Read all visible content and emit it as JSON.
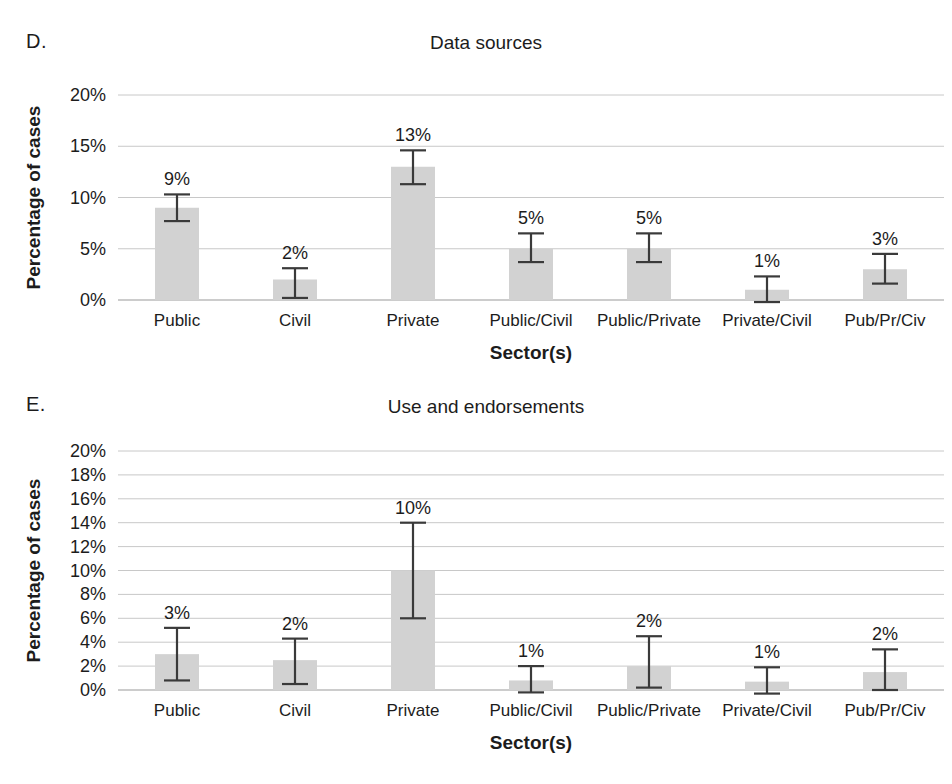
{
  "figure": {
    "background": "#ffffff",
    "bar_color": "#d2d2d2",
    "error_bar_color": "#3a3a3a",
    "gridline_color": "#c8c8c8"
  },
  "panels": [
    {
      "letter": "D.",
      "title": "Data sources"
    },
    {
      "letter": "E.",
      "title": "Use and endorsements"
    }
  ],
  "chart_data": [
    {
      "type": "bar",
      "panel": "D",
      "title": "Data sources",
      "xlabel": "Sector(s)",
      "ylabel": "Percentage of cases",
      "categories": [
        "Public",
        "Civil",
        "Private",
        "Public/Civil",
        "Public/Private",
        "Private/Civil",
        "Pub/Pr/Civ"
      ],
      "values": [
        9,
        2,
        13,
        5,
        5,
        1,
        3
      ],
      "value_labels": [
        "9%",
        "2%",
        "13%",
        "5%",
        "5%",
        "1%",
        "3%"
      ],
      "error_low": [
        7.7,
        0.2,
        11.3,
        3.7,
        3.7,
        -0.2,
        1.6
      ],
      "error_high": [
        10.3,
        3.1,
        14.6,
        6.5,
        6.5,
        2.3,
        4.5
      ],
      "ylim": [
        0,
        20
      ],
      "yticks": [
        0,
        5,
        10,
        15,
        20
      ],
      "ytick_labels": [
        "0%",
        "5%",
        "10%",
        "15%",
        "20%"
      ],
      "grid": true,
      "legend": "none"
    },
    {
      "type": "bar",
      "panel": "E",
      "title": "Use and endorsements",
      "xlabel": "Sector(s)",
      "ylabel": "Percentage of cases",
      "categories": [
        "Public",
        "Civil",
        "Private",
        "Public/Civil",
        "Public/Private",
        "Private/Civil",
        "Pub/Pr/Civ"
      ],
      "values": [
        3,
        2.5,
        10,
        0.8,
        2,
        0.7,
        1.5
      ],
      "value_labels": [
        "3%",
        "2%",
        "10%",
        "1%",
        "2%",
        "1%",
        "2%"
      ],
      "error_low": [
        0.8,
        0.5,
        6.0,
        -0.2,
        0.2,
        -0.3,
        0.0
      ],
      "error_high": [
        5.2,
        4.3,
        14.0,
        2.0,
        4.5,
        1.9,
        3.4
      ],
      "ylim": [
        0,
        20
      ],
      "yticks": [
        0,
        2,
        4,
        6,
        8,
        10,
        12,
        14,
        16,
        18,
        20
      ],
      "ytick_labels": [
        "0%",
        "2%",
        "4%",
        "6%",
        "8%",
        "10%",
        "12%",
        "14%",
        "16%",
        "18%",
        "20%"
      ],
      "grid": true,
      "legend": "none"
    }
  ]
}
